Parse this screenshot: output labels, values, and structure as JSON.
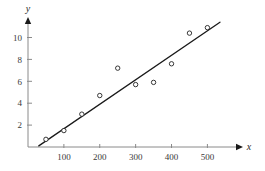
{
  "figure": {
    "background_color": "#ffffff",
    "width": 265,
    "height": 171
  },
  "chart_data": {
    "type": "scatter",
    "title": "",
    "subtitle": "",
    "xlabel": "x",
    "ylabel": "y",
    "xlim": [
      0,
      560
    ],
    "ylim": [
      0,
      11.8
    ],
    "grid": false,
    "legend": null,
    "marker": {
      "shape": "open-circle",
      "edge_color": "#222222",
      "fill_color": "#ffffff",
      "radius": 2.2
    },
    "x_ticks": [
      100,
      200,
      300,
      400,
      500
    ],
    "x_tick_labels": [
      "100",
      "200",
      "300",
      "400",
      "500"
    ],
    "y_ticks": [
      2,
      4,
      6,
      8,
      10
    ],
    "y_tick_labels": [
      "2",
      "4",
      "6",
      "8",
      "10"
    ],
    "axis_color": "#8a8a8a",
    "line_color": "#1a1a1a",
    "x": [
      50,
      100,
      150,
      200,
      250,
      300,
      350,
      400,
      450,
      500
    ],
    "y": [
      0.7,
      1.5,
      3.0,
      4.7,
      7.2,
      5.7,
      5.9,
      7.6,
      10.4,
      10.9
    ],
    "points": [
      {
        "x": 50,
        "y": 0.7
      },
      {
        "x": 100,
        "y": 1.5
      },
      {
        "x": 150,
        "y": 3.0
      },
      {
        "x": 200,
        "y": 4.7
      },
      {
        "x": 250,
        "y": 7.2
      },
      {
        "x": 300,
        "y": 5.7
      },
      {
        "x": 350,
        "y": 5.9
      },
      {
        "x": 400,
        "y": 7.6
      },
      {
        "x": 450,
        "y": 10.4
      },
      {
        "x": 500,
        "y": 10.9
      }
    ],
    "trendline": {
      "type": "linear-fit",
      "x_start": 30,
      "y_start": 0.1,
      "x_end": 535,
      "y_end": 11.4
    }
  }
}
